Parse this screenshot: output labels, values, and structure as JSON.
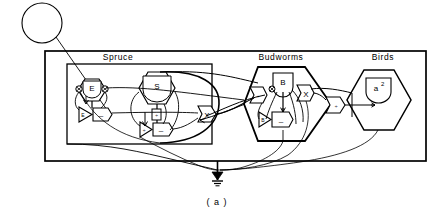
{
  "figure": {
    "caption": "( a )",
    "type": "energy-systems-diagram"
  },
  "source": {
    "name": "energy-source-circle",
    "label": ""
  },
  "groups": [
    {
      "id": "spruce",
      "label": "Spruce"
    },
    {
      "id": "budworms",
      "label": "Budworms"
    },
    {
      "id": "birds",
      "label": "Birds"
    }
  ],
  "symbols": {
    "spruce": {
      "storage_e": "E",
      "storage_s": "S",
      "amplifier_e": "E",
      "minus_e": "–",
      "divide_s": "÷",
      "amplifier_s": "÷",
      "minus_s": "–",
      "multiplier": "X"
    },
    "budworms": {
      "storage_b": "B",
      "divide": "÷",
      "multiplier": "X",
      "amplifier_b": "B",
      "minus": "–"
    },
    "birds": {
      "storage_a2": "a",
      "storage_a2_sup": "2",
      "divide": "÷"
    }
  },
  "heat_sink": {
    "name": "heat-sink-ground"
  },
  "colors": {
    "line": "#000000",
    "background": "#ffffff"
  }
}
